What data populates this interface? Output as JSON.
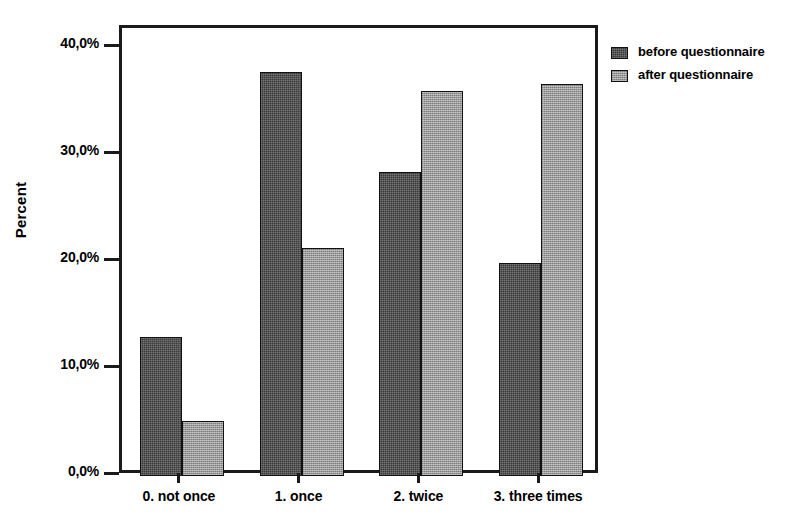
{
  "chart_data": {
    "type": "bar",
    "title": "",
    "xlabel": "",
    "ylabel": "Percent",
    "categories": [
      "0. not once",
      "1. once",
      "2. twice",
      "3. three times"
    ],
    "series": [
      {
        "name": "before questionnaire",
        "values": [
          13.0,
          37.8,
          28.4,
          19.9
        ]
      },
      {
        "name": "after questionnaire",
        "values": [
          5.1,
          21.3,
          36.0,
          36.6
        ]
      }
    ],
    "ylim": [
      0,
      42
    ],
    "yticks": [
      0,
      10,
      20,
      30,
      40
    ],
    "ytick_labels": [
      "0,0%",
      "10,0%",
      "20,0%",
      "30,0%",
      "40,0%"
    ],
    "grid": false,
    "legend_position": "right",
    "unit": "percent",
    "decimal_separator": ","
  },
  "axes": {
    "y_title": "Percent"
  },
  "legend": {
    "entries": [
      {
        "label": "before questionnaire",
        "swatch": "dark-dither"
      },
      {
        "label": "after questionnaire",
        "swatch": "light-dither"
      }
    ]
  }
}
